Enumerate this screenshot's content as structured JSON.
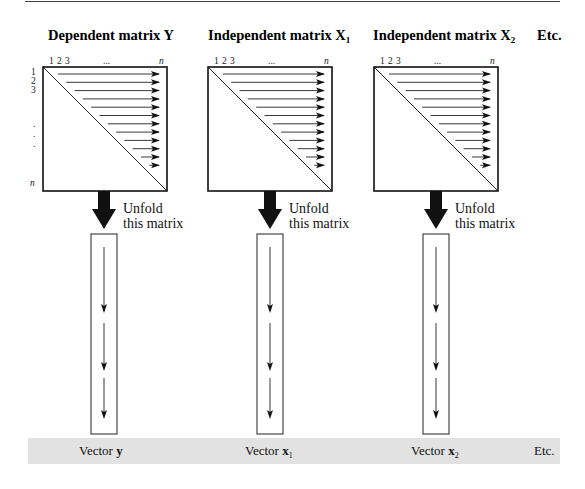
{
  "diagram": {
    "matrices": [
      {
        "title_prefix": "Dependent matrix ",
        "symbol": "Y",
        "subscript": ""
      },
      {
        "title_prefix": "Independent matrix ",
        "symbol": "X",
        "subscript": "1"
      },
      {
        "title_prefix": "Independent matrix ",
        "symbol": "X",
        "subscript": "2"
      }
    ],
    "etc_top": "Etc.",
    "column_labels": {
      "one": "1",
      "two": "2",
      "three": "3",
      "dots": "...",
      "n": "n"
    },
    "row_labels": {
      "one": "1",
      "two": "2",
      "three": "3",
      "dots": ".",
      "n": "n"
    },
    "arrows_per_matrix": 12,
    "unfold_label_line1": "Unfold",
    "unfold_label_line2": "this matrix",
    "vector_segments": 3,
    "vectors": [
      {
        "prefix": "Vector ",
        "symbol": "y",
        "subscript": ""
      },
      {
        "prefix": "Vector ",
        "symbol": "x",
        "subscript": "1"
      },
      {
        "prefix": "Vector ",
        "symbol": "x",
        "subscript": "2"
      }
    ],
    "etc_bottom": "Etc.",
    "colors": {
      "band": "#e2e2e2",
      "ink": "#111111",
      "rule": "#444444"
    }
  }
}
